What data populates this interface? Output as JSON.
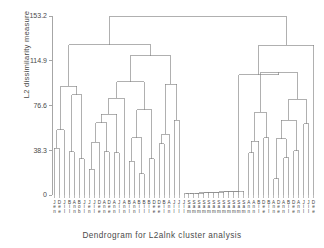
{
  "chart_data": {
    "type": "dendrogram",
    "title": "",
    "xlabel": "Dendrogram for L2alnk cluster analysis",
    "ylabel": "L2 dissimilarity measure",
    "ylim": [
      0,
      153.2
    ],
    "yticks": [
      0,
      38.3,
      76.6,
      114.9,
      153.2
    ],
    "ytick_labels": [
      "0",
      "38.3",
      "76.6",
      "114.9",
      "153.2"
    ],
    "grid": false,
    "legend": null,
    "n_leaves": 50,
    "leaf_labels": [
      "Jen",
      "Dee",
      "Jil",
      "Bob",
      "Ann",
      "Bil",
      "Jen",
      "Jil",
      "Dee",
      "Ann",
      "Dee",
      "Ann",
      "Jil",
      "Ann",
      "Bil",
      "Ann",
      "Bil",
      "Bil",
      "Bil",
      "Dee",
      "Dee",
      "Bil",
      "Ann",
      "Jil",
      "Jil",
      "Jil",
      "Sam",
      "Sam",
      "Sam",
      "Sam",
      "Sam",
      "Sam",
      "Sam",
      "Sam",
      "Sam",
      "Sam",
      "Sam",
      "Sam",
      "Ann",
      "Ann",
      "Bil",
      "Dee",
      "Bil",
      "Ann",
      "Dee",
      "Ann",
      "Bil",
      "Dee",
      "Ann",
      "Jil",
      "Jil",
      "Dee"
    ],
    "merge_heights": [
      153.2,
      128.5,
      120.0,
      103.7,
      97.5,
      93.6,
      90.0,
      84.0,
      82.0,
      78.0,
      76.0,
      72.0,
      70.0,
      68.0,
      62.0,
      60.0,
      58.0,
      55.0,
      52.0,
      50.0,
      48.0,
      46.0,
      44.0,
      42.0,
      40.0,
      38.0,
      36.0,
      34.0,
      32.0,
      30.0,
      28.0,
      26.0,
      24.0,
      22.0,
      20.0,
      18.0,
      16.0,
      14.0,
      12.0,
      10.0,
      8.0,
      6.0,
      4.0,
      3.0,
      2.5,
      2.0,
      1.5,
      1.0
    ]
  },
  "axes": {
    "y_axis_name": "L2 dissimilarity measure",
    "x_axis_title": "Dendrogram for L2alnk cluster analysis"
  },
  "ticks": {
    "t0": "0",
    "t1": "38.3",
    "t2": "76.6",
    "t3": "114.9",
    "t4": "153.2"
  },
  "leaves": [
    {
      "label": "Jen",
      "c": [
        "J",
        "e",
        "n"
      ]
    },
    {
      "label": "Dee",
      "c": [
        "D",
        "e",
        "e"
      ]
    },
    {
      "label": "Jil",
      "c": [
        "J",
        "i",
        "l"
      ]
    },
    {
      "label": "Bil",
      "c": [
        "B",
        "i",
        "l"
      ]
    },
    {
      "label": "Ann",
      "c": [
        "A",
        "n",
        "n"
      ]
    },
    {
      "label": "Bob",
      "c": [
        "B",
        "o",
        "b"
      ]
    },
    {
      "label": "Jil",
      "c": [
        "J",
        "i",
        "l"
      ]
    },
    {
      "label": "Jen",
      "c": [
        "J",
        "e",
        "n"
      ]
    },
    {
      "label": "Jil",
      "c": [
        "J",
        "i",
        "l"
      ]
    },
    {
      "label": "Dee",
      "c": [
        "D",
        "e",
        "e"
      ]
    },
    {
      "label": "Ann",
      "c": [
        "A",
        "n",
        "n"
      ]
    },
    {
      "label": "Dee",
      "c": [
        "D",
        "e",
        "e"
      ]
    },
    {
      "label": "Ann",
      "c": [
        "A",
        "n",
        "n"
      ]
    },
    {
      "label": "Jil",
      "c": [
        "J",
        "i",
        "l"
      ]
    },
    {
      "label": "Ann",
      "c": [
        "A",
        "n",
        "n"
      ]
    },
    {
      "label": "Bil",
      "c": [
        "B",
        "i",
        "l"
      ]
    },
    {
      "label": "Ann",
      "c": [
        "A",
        "n",
        "n"
      ]
    },
    {
      "label": "Bil",
      "c": [
        "B",
        "i",
        "l"
      ]
    },
    {
      "label": "Bil",
      "c": [
        "B",
        "i",
        "l"
      ]
    },
    {
      "label": "Bil",
      "c": [
        "B",
        "i",
        "l"
      ]
    },
    {
      "label": "Dee",
      "c": [
        "D",
        "e",
        "e"
      ]
    },
    {
      "label": "Dee",
      "c": [
        "D",
        "e",
        "e"
      ]
    },
    {
      "label": "Bil",
      "c": [
        "B",
        "i",
        "l"
      ]
    },
    {
      "label": "Ann",
      "c": [
        "A",
        "n",
        "n"
      ]
    },
    {
      "label": "Jil",
      "c": [
        "J",
        "i",
        "l"
      ]
    },
    {
      "label": "Jil",
      "c": [
        "J",
        "i",
        "l"
      ]
    },
    {
      "label": "Jil",
      "c": [
        "J",
        "i",
        "l"
      ]
    },
    {
      "label": "Sam",
      "c": [
        "S",
        "a",
        "m"
      ]
    },
    {
      "label": "Sam",
      "c": [
        "S",
        "a",
        "m"
      ]
    },
    {
      "label": "Sam",
      "c": [
        "S",
        "a",
        "m"
      ]
    },
    {
      "label": "Sam",
      "c": [
        "S",
        "a",
        "m"
      ]
    },
    {
      "label": "Sam",
      "c": [
        "S",
        "a",
        "m"
      ]
    },
    {
      "label": "Sam",
      "c": [
        "S",
        "a",
        "m"
      ]
    },
    {
      "label": "Sam",
      "c": [
        "S",
        "a",
        "m"
      ]
    },
    {
      "label": "Sam",
      "c": [
        "S",
        "a",
        "m"
      ]
    },
    {
      "label": "Sam",
      "c": [
        "S",
        "a",
        "m"
      ]
    },
    {
      "label": "Sam",
      "c": [
        "S",
        "a",
        "m"
      ]
    },
    {
      "label": "Sam",
      "c": [
        "S",
        "a",
        "m"
      ]
    },
    {
      "label": "Sam",
      "c": [
        "S",
        "a",
        "m"
      ]
    },
    {
      "label": "Ann",
      "c": [
        "A",
        "n",
        "n"
      ]
    },
    {
      "label": "Ann",
      "c": [
        "A",
        "n",
        "n"
      ]
    },
    {
      "label": "Bil",
      "c": [
        "B",
        "i",
        "l"
      ]
    },
    {
      "label": "Dee",
      "c": [
        "D",
        "e",
        "e"
      ]
    },
    {
      "label": "Bil",
      "c": [
        "B",
        "i",
        "l"
      ]
    },
    {
      "label": "Ann",
      "c": [
        "A",
        "n",
        "n"
      ]
    },
    {
      "label": "Dee",
      "c": [
        "D",
        "e",
        "e"
      ]
    },
    {
      "label": "Ann",
      "c": [
        "A",
        "n",
        "n"
      ]
    },
    {
      "label": "Bil",
      "c": [
        "B",
        "i",
        "l"
      ]
    },
    {
      "label": "Dee",
      "c": [
        "D",
        "e",
        "e"
      ]
    },
    {
      "label": "Ann",
      "c": [
        "A",
        "n",
        "n"
      ]
    },
    {
      "label": "Jil",
      "c": [
        "J",
        "i",
        "l"
      ]
    },
    {
      "label": "Jil",
      "c": [
        "J",
        "i",
        "l"
      ]
    },
    {
      "label": "Dee",
      "c": [
        "D",
        "e",
        "e"
      ]
    }
  ],
  "style": {
    "line_color": "#808080",
    "axis_color": "#909090",
    "text_color": "#3d3d3d",
    "background": "#ffffff"
  }
}
